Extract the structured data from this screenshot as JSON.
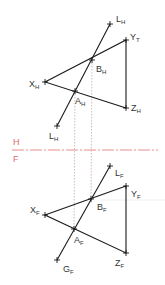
{
  "colors": {
    "line": "#1a1a1a",
    "fold_line": "#e88080",
    "projector": "#c8a8a8",
    "label": "#333333",
    "fold_label": "#e06a6a"
  },
  "fold": {
    "upper_view": "H",
    "lower_view": "F",
    "y": 150
  },
  "top_view": {
    "points": {
      "L_top": {
        "main": "L",
        "sub": "H",
        "x": 110,
        "y": 24
      },
      "Y": {
        "main": "Y",
        "sub": "T",
        "x": 126,
        "y": 40
      },
      "B": {
        "main": "B",
        "sub": "H",
        "x": 92,
        "y": 60
      },
      "X": {
        "main": "X",
        "sub": "H",
        "x": 45,
        "y": 82
      },
      "A": {
        "main": "A",
        "sub": "H",
        "x": 75,
        "y": 91
      },
      "Z": {
        "main": "Z",
        "sub": "H",
        "x": 126,
        "y": 108
      },
      "L_bottom": {
        "main": "L",
        "sub": "H",
        "x": 57,
        "y": 126
      }
    }
  },
  "front_view": {
    "points": {
      "L": {
        "main": "L",
        "sub": "F",
        "x": 110,
        "y": 166
      },
      "Y": {
        "main": "Y",
        "sub": "F",
        "x": 126,
        "y": 186
      },
      "B": {
        "main": "B",
        "sub": "F",
        "x": 91,
        "y": 199
      },
      "X": {
        "main": "X",
        "sub": "F",
        "x": 45,
        "y": 215
      },
      "A": {
        "main": "A",
        "sub": "F",
        "x": 74,
        "y": 229
      },
      "Z": {
        "main": "Z",
        "sub": "F",
        "x": 126,
        "y": 253
      },
      "G": {
        "main": "G",
        "sub": "F",
        "x": 57,
        "y": 260
      }
    }
  }
}
